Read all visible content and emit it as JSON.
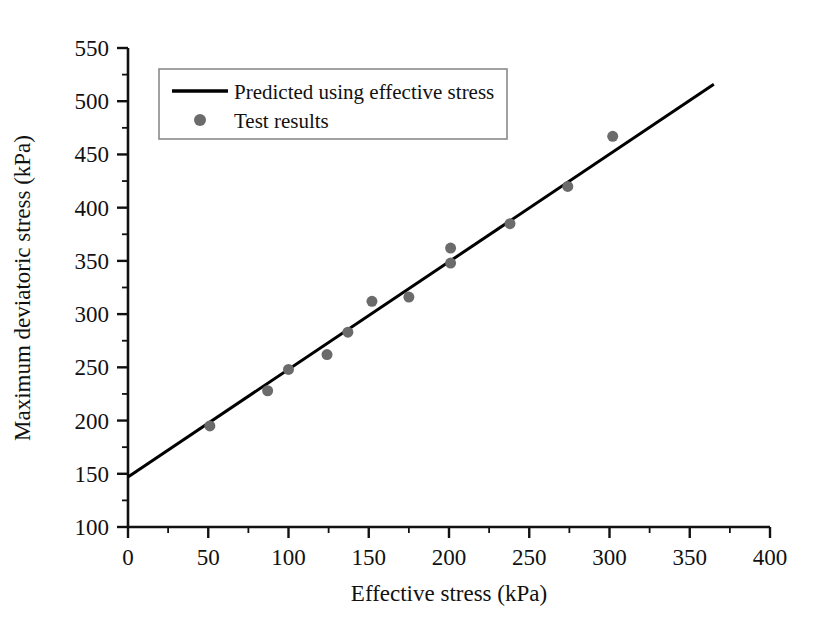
{
  "chart_data": {
    "type": "scatter",
    "title": "",
    "xlabel": "Effective stress (kPa)",
    "ylabel": "Maximum deviatoric stress (kPa)",
    "xlim": [
      0,
      400
    ],
    "ylim": [
      100,
      550
    ],
    "xticks": [
      0,
      50,
      100,
      150,
      200,
      250,
      300,
      350,
      400
    ],
    "yticks": [
      100,
      150,
      200,
      250,
      300,
      350,
      400,
      450,
      500,
      550
    ],
    "xtick_labels": [
      "0",
      "50",
      "100",
      "150",
      "200",
      "250",
      "300",
      "350",
      "400"
    ],
    "ytick_labels": [
      "100",
      "150",
      "200",
      "250",
      "300",
      "350",
      "400",
      "450",
      "500",
      "550"
    ],
    "x_minor_tick_step": 25,
    "y_minor_tick_step": 25,
    "grid": false,
    "legend_position": "upper left",
    "series": [
      {
        "name": "Predicted using effective stress",
        "type": "line",
        "color": "#000000",
        "line_width": 3,
        "x": [
          0,
          365
        ],
        "y": [
          147,
          516
        ]
      },
      {
        "name": "Test results",
        "type": "scatter",
        "color": "#6b6b6b",
        "marker": "circle",
        "marker_size": 11,
        "points": [
          {
            "x": 51,
            "y": 195
          },
          {
            "x": 87,
            "y": 228
          },
          {
            "x": 100,
            "y": 248
          },
          {
            "x": 124,
            "y": 262
          },
          {
            "x": 137,
            "y": 283
          },
          {
            "x": 152,
            "y": 312
          },
          {
            "x": 175,
            "y": 316
          },
          {
            "x": 201,
            "y": 362
          },
          {
            "x": 201,
            "y": 348
          },
          {
            "x": 238,
            "y": 385
          },
          {
            "x": 274,
            "y": 420
          },
          {
            "x": 302,
            "y": 467
          }
        ]
      }
    ]
  },
  "legend": {
    "entries": [
      {
        "label": "Predicted using effective stress",
        "marker": "line"
      },
      {
        "label": "Test results",
        "marker": "dot"
      }
    ]
  },
  "colors": {
    "axis": "#111111",
    "line": "#000000",
    "marker": "#6b6b6b",
    "legend_border": "#8a8a8a",
    "background": "#ffffff"
  }
}
